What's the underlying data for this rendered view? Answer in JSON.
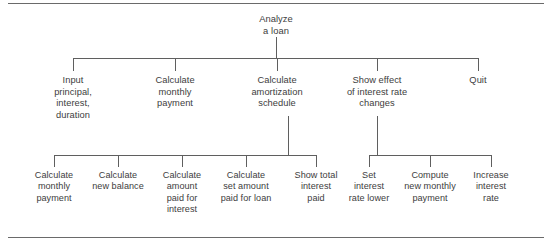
{
  "figure": {
    "type": "hierarchy-tree-diagram",
    "line_color": "#5f5f5f",
    "rule_color": "#6a6a6a",
    "text_color": "#3d3d3d",
    "background": "#ffffff"
  },
  "tree": {
    "root": {
      "label": "Analyze\na loan"
    },
    "level2": [
      {
        "label": "Input\nprincipal,\ninterest,\nduration"
      },
      {
        "label": "Calculate\nmonthly\npayment"
      },
      {
        "label": "Calculate\namortization\nschedule"
      },
      {
        "label": "Show effect\nof interest rate\nchanges"
      },
      {
        "label": "Quit"
      }
    ],
    "level3_left": [
      {
        "label": "Calculate\nmonthly\npayment"
      },
      {
        "label": "Calculate\nnew balance"
      },
      {
        "label": "Calculate\namount\npaid for\ninterest"
      },
      {
        "label": "Calculate\nset amount\npaid for loan"
      },
      {
        "label": "Show total\ninterest\npaid"
      }
    ],
    "level3_right": [
      {
        "label": "Set\ninterest\nrate lower"
      },
      {
        "label": "Compute\nnew monthly\npayment"
      },
      {
        "label": "Increase\ninterest\nrate"
      }
    ]
  }
}
